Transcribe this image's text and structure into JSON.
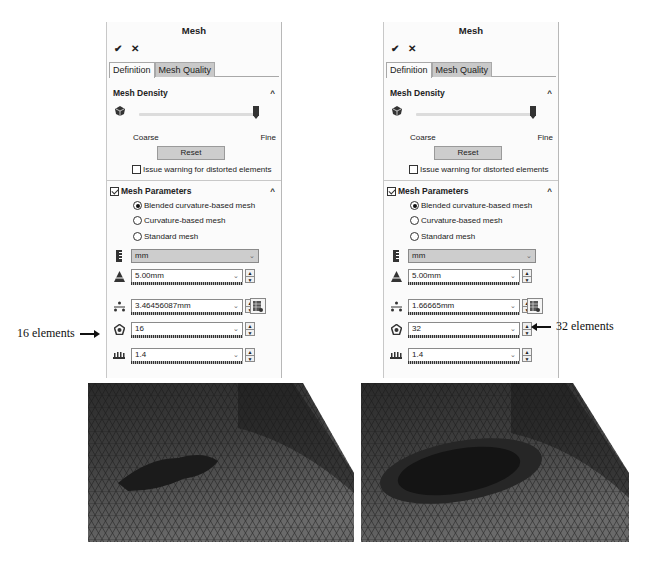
{
  "panels": [
    {
      "title": "Mesh",
      "ok_icon": "✔",
      "cancel_icon": "✕",
      "tabs": [
        {
          "label": "Definition"
        },
        {
          "label": "Mesh Quality"
        }
      ],
      "density": {
        "heading": "Mesh Density",
        "coarse_label": "Coarse",
        "fine_label": "Fine",
        "reset_label": "Reset",
        "warn_label": "Issue warning for distorted elements"
      },
      "parameters": {
        "heading": "Mesh Parameters",
        "options": [
          {
            "label": "Blended curvature-based mesh"
          },
          {
            "label": "Curvature-based mesh"
          },
          {
            "label": "Standard mesh"
          }
        ],
        "unit": "mm",
        "max_element_size": "5.00mm",
        "min_element_size": "3.46456087mm",
        "min_elements_in_circle": "16",
        "growth_ratio": "1.4"
      }
    },
    {
      "title": "Mesh",
      "ok_icon": "✔",
      "cancel_icon": "✕",
      "tabs": [
        {
          "label": "Definition"
        },
        {
          "label": "Mesh Quality"
        }
      ],
      "density": {
        "heading": "Mesh Density",
        "coarse_label": "Coarse",
        "fine_label": "Fine",
        "reset_label": "Reset",
        "warn_label": "Issue warning for distorted elements"
      },
      "parameters": {
        "heading": "Mesh Parameters",
        "options": [
          {
            "label": "Blended curvature-based mesh"
          },
          {
            "label": "Curvature-based mesh"
          },
          {
            "label": "Standard mesh"
          }
        ],
        "unit": "mm",
        "max_element_size": "5.00mm",
        "min_element_size": "1.66665mm",
        "min_elements_in_circle": "32",
        "growth_ratio": "1.4"
      }
    }
  ],
  "annotations": {
    "left": "16 elements",
    "right": "32 elements"
  },
  "icons": {
    "dropdown": "⌄",
    "caret_up": "^",
    "spin_up": "▲",
    "spin_down": "▼"
  }
}
